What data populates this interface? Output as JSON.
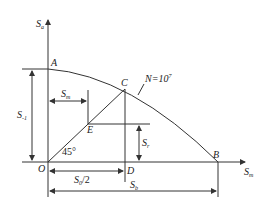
{
  "diagram": {
    "axes": {
      "y_label": "S_a",
      "y_label_main": "S",
      "y_label_sub": "a",
      "x_label": "S_m",
      "x_label_main": "S",
      "x_label_sub": "m"
    },
    "curve_label": "N=10",
    "curve_label_sup": "7",
    "points": {
      "A": "A",
      "B": "B",
      "C": "C",
      "D": "D",
      "E": "E",
      "O": "O"
    },
    "angle_label": "45°",
    "dimensions": {
      "s_minus1_main": "S",
      "s_minus1_sub": "-1",
      "sm_main": "S",
      "sm_sub": "m",
      "sr_main": "S",
      "sr_sub": "r",
      "s0_half_main": "S",
      "s0_half_sub": "0",
      "s0_half_tail": "/2",
      "sb_main": "S",
      "sb_sub": "b"
    },
    "colors": {
      "line": "#333333",
      "text": "#222222",
      "background": "#ffffff"
    }
  }
}
